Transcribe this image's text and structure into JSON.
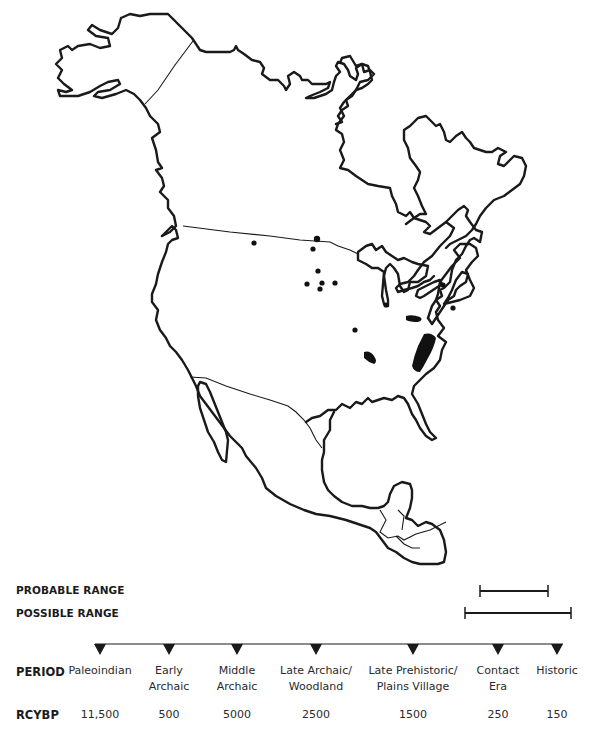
{
  "map": {
    "region": "North America",
    "site_marks": {
      "dots": [
        "site",
        "site",
        "site",
        "site",
        "site",
        "site",
        "site",
        "site",
        "site",
        "site",
        "site",
        "site"
      ],
      "areas": [
        "site-area",
        "site-area",
        "site-area"
      ]
    }
  },
  "legend": {
    "probable_range_label": "PROBABLE RANGE",
    "possible_range_label": "POSSIBLE RANGE",
    "probable_range_periods": [
      "Contact Era",
      "Historic"
    ],
    "possible_range_periods": [
      "Late Prehistoric/ Plains Village",
      "Historic"
    ]
  },
  "timeline": {
    "period_label": "PERIOD",
    "rcybp_label": "RCYBP",
    "periods": [
      {
        "name": "Paleoindian",
        "rcybp": "11,500"
      },
      {
        "name": "Early\nArchaic",
        "rcybp": "500"
      },
      {
        "name": "Middle\nArchaic",
        "rcybp": "5000"
      },
      {
        "name": "Late Archaic/\nWoodland",
        "rcybp": "2500"
      },
      {
        "name": "Late Prehistoric/\nPlains Village",
        "rcybp": "1500"
      },
      {
        "name": "Contact\nEra",
        "rcybp": "250"
      },
      {
        "name": "Historic",
        "rcybp": "150"
      }
    ]
  },
  "colors": {
    "ink": "#1a1a1a",
    "background": "#ffffff"
  }
}
